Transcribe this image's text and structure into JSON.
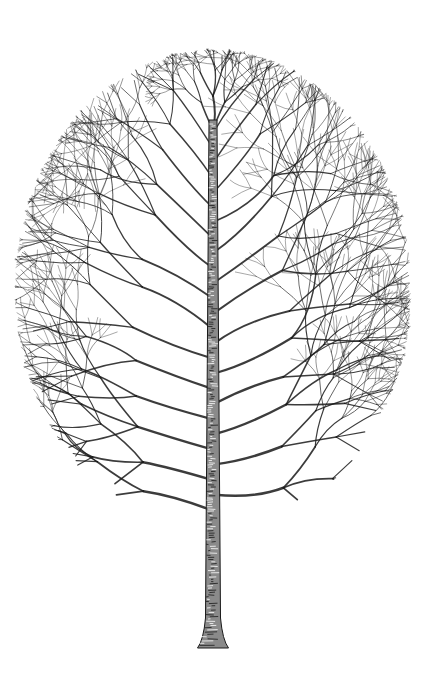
{
  "image": {
    "subject": "pen-and-ink illustration of a leafless deciduous tree",
    "style": "black ink line drawing on white",
    "background_color": "#ffffff",
    "ink_color": "#1a1a1a"
  },
  "tree": {
    "canopy": {
      "shape": "tall ellipse",
      "center_x": 213,
      "center_y": 290,
      "radius_x": 198,
      "radius_y": 240,
      "top_y": 55,
      "bottom_y": 530,
      "left_x": 15,
      "right_x": 410
    },
    "trunk": {
      "center_x": 213,
      "top_y": 120,
      "bottom_y": 648,
      "width_top": 8,
      "width_mid": 15,
      "width_base": 31
    },
    "branching": {
      "seed": 7,
      "main_branches": 26,
      "depth": 6
    }
  }
}
